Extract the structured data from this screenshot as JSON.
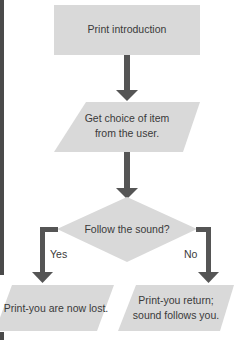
{
  "diagram": {
    "colors": {
      "shape_fill": "#d9d9d9",
      "arrow": "#555555",
      "text": "#3a3a3a",
      "side_bar": "#4a4a4a"
    },
    "nodes": [
      {
        "id": "start",
        "shape": "rectangle",
        "label": "Print introduction"
      },
      {
        "id": "input",
        "shape": "parallelogram",
        "label_line1": "Get choice of item",
        "label_line2": "from the user."
      },
      {
        "id": "decision",
        "shape": "diamond",
        "label": "Follow the sound?"
      },
      {
        "id": "lost",
        "shape": "parallelogram",
        "label": "Print-you are now lost."
      },
      {
        "id": "return",
        "shape": "parallelogram",
        "label_line1": "Print-you return;",
        "label_line2": "sound follows you."
      }
    ],
    "edges": [
      {
        "from": "start",
        "to": "input",
        "label": ""
      },
      {
        "from": "input",
        "to": "decision",
        "label": ""
      },
      {
        "from": "decision",
        "to": "lost",
        "label": "Yes"
      },
      {
        "from": "decision",
        "to": "return",
        "label": "No"
      }
    ]
  }
}
